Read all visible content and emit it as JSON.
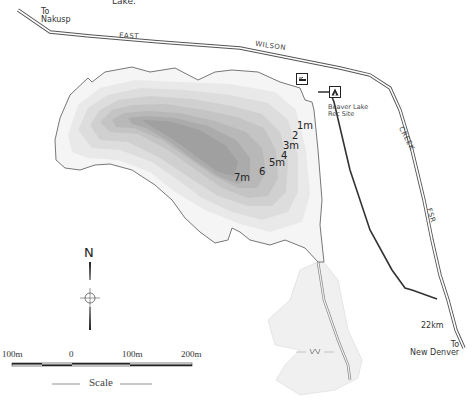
{
  "map": {
    "top_caption": "Lake.",
    "road_labels": {
      "to_nakusp": [
        "To",
        "Nakusp"
      ],
      "east": "EAST",
      "wilson": "WILSON",
      "creek": "CREEK",
      "fsr": "FSR",
      "km_marker": "22km",
      "to_new_denver": [
        "To",
        "New Denver"
      ]
    },
    "facilities": {
      "boat_launch_icon": "boat-launch-icon",
      "campsite_icon": "campsite-tent-icon",
      "rec_site_label": [
        "Beaver Lake",
        "Rec Site"
      ]
    },
    "depth_labels": [
      "1m",
      "2",
      "3m",
      "4",
      "5m",
      "6",
      "7m"
    ],
    "north_arrow": {
      "label": "N"
    },
    "scale_bar": {
      "ticks": [
        "100m",
        "0",
        "100m",
        "200m"
      ],
      "title": "Scale"
    },
    "colors": {
      "land": "#ffffff",
      "shoreline": "#777777",
      "road_casing": "#555555",
      "trail": "#333333",
      "depth_shades": [
        "#f2f2f2",
        "#e8e8e8",
        "#dedede",
        "#d3d3d3",
        "#c8c8c8",
        "#bcbcbc",
        "#b0b0b0",
        "#a2a2a2"
      ],
      "wetland": "#efefef"
    }
  }
}
